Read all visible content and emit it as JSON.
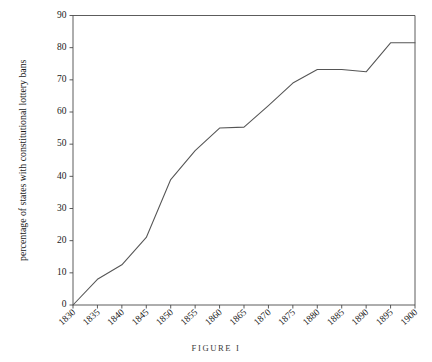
{
  "figure": {
    "caption": "FIGURE I"
  },
  "chart_data": {
    "type": "line",
    "title": "",
    "subtitle": "",
    "xlabel": "",
    "ylabel": "percentage of states with constitutional lottery bans",
    "xlim": [
      1830,
      1900
    ],
    "ylim": [
      0,
      90
    ],
    "grid": false,
    "legend": null,
    "legend_position": "none",
    "x_tick_labels": [
      "1830",
      "1835",
      "1840",
      "1845",
      "1850",
      "1855",
      "1860",
      "1865",
      "1870",
      "1875",
      "1880",
      "1885",
      "1890",
      "1895",
      "1900"
    ],
    "y_tick_labels": [
      "0",
      "10",
      "20",
      "30",
      "40",
      "50",
      "60",
      "70",
      "80",
      "90"
    ],
    "x_ticks": [
      1830,
      1835,
      1840,
      1845,
      1850,
      1855,
      1860,
      1865,
      1870,
      1875,
      1880,
      1885,
      1890,
      1895,
      1900
    ],
    "y_ticks": [
      0,
      10,
      20,
      30,
      40,
      50,
      60,
      70,
      80,
      90
    ],
    "x": [
      1830,
      1835,
      1840,
      1845,
      1850,
      1855,
      1860,
      1865,
      1870,
      1875,
      1880,
      1885,
      1890,
      1895,
      1900
    ],
    "values": [
      0,
      8,
      12.5,
      21,
      39,
      48,
      55,
      55.3,
      62,
      69,
      73.2,
      73.2,
      72.5,
      81.5,
      81.5
    ],
    "series": [
      {
        "name": "percentage of states with constitutional lottery bans",
        "values": [
          0,
          8,
          12.5,
          21,
          39,
          48,
          55,
          55.3,
          62,
          69,
          73.2,
          73.2,
          72.5,
          81.5,
          81.5
        ],
        "color": "#555555"
      }
    ],
    "colors": {
      "line": "#555555",
      "axis": "#4a4a4a",
      "text": "#1a1a1a",
      "background": "#ffffff"
    }
  }
}
